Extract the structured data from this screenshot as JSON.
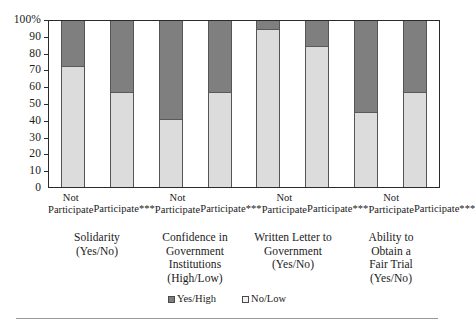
{
  "chart_data": {
    "type": "bar",
    "subtype": "stacked-100-percent",
    "title": "",
    "xlabel": "",
    "ylabel": "",
    "ylim": [
      0,
      100
    ],
    "yticks": [
      "0",
      "10",
      "20",
      "30",
      "40",
      "50",
      "60",
      "70",
      "80",
      "90",
      "100%"
    ],
    "ytick_values": [
      0,
      10,
      20,
      30,
      40,
      50,
      60,
      70,
      80,
      90,
      100
    ],
    "grid": false,
    "legend_position": "bottom-center",
    "categories": [
      "Not Participate",
      "Participate***",
      "Not Participate",
      "Participate***",
      "Not Participate",
      "Participate***",
      "Not Participate",
      "Participate***"
    ],
    "groups": [
      {
        "label": "Solidarity\n(Yes/No)",
        "lines": [
          "Solidarity",
          "(Yes/No)"
        ],
        "categories": [
          "Not Participate",
          "Participate***"
        ]
      },
      {
        "label": "Confidence in Government Institutions (High/Low)",
        "lines": [
          "Confidence in",
          "Government",
          "Institutions",
          "(High/Low)"
        ],
        "categories": [
          "Not Participate",
          "Participate***"
        ]
      },
      {
        "label": "Written Letter to Government (Yes/No)",
        "lines": [
          "Written Letter to",
          "Government",
          "(Yes/No)"
        ],
        "categories": [
          "Not Participate",
          "Participate***"
        ]
      },
      {
        "label": "Ability to Obtain a Fair Trial (Yes/No)",
        "lines": [
          "Ability to",
          "Obtain a",
          "Fair Trial",
          "(Yes/No)"
        ],
        "categories": [
          "Not Participate",
          "Participate***"
        ]
      }
    ],
    "series": [
      {
        "name": "No/Low",
        "color": "#dcdcdc",
        "values": [
          73,
          57,
          41,
          57,
          95,
          85,
          45,
          57
        ]
      },
      {
        "name": "Yes/High",
        "color": "#7f7f7f",
        "values": [
          27,
          43,
          59,
          43,
          5,
          15,
          55,
          43
        ]
      }
    ],
    "legend": [
      {
        "label": "Yes/High",
        "color": "#7f7f7f"
      },
      {
        "label": "No/Low",
        "color": "#f2f2f2"
      }
    ],
    "bars": [
      {
        "group": "Solidarity",
        "category": "Not Participate",
        "low": 73,
        "high": 27
      },
      {
        "group": "Solidarity",
        "category": "Participate***",
        "low": 57,
        "high": 43
      },
      {
        "group": "Confidence in Government Institutions",
        "category": "Not Participate",
        "low": 41,
        "high": 59
      },
      {
        "group": "Confidence in Government Institutions",
        "category": "Participate***",
        "low": 57,
        "high": 43
      },
      {
        "group": "Written Letter to Government",
        "category": "Not Participate",
        "low": 95,
        "high": 5
      },
      {
        "group": "Written Letter to Government",
        "category": "Participate***",
        "low": 85,
        "high": 15
      },
      {
        "group": "Ability to Obtain a Fair Trial",
        "category": "Not Participate",
        "low": 45,
        "high": 55
      },
      {
        "group": "Ability to Obtain a Fair Trial",
        "category": "Participate***",
        "low": 57,
        "high": 43
      }
    ]
  },
  "xaxis": {
    "tick_labels": [
      {
        "line1": "Not",
        "line2": "Participate"
      },
      {
        "line1": "Participate***",
        "line2": ""
      },
      {
        "line1": "Not",
        "line2": "Participate"
      },
      {
        "line1": "Participate***",
        "line2": ""
      },
      {
        "line1": "Not",
        "line2": "Participate"
      },
      {
        "line1": "Participate***",
        "line2": ""
      },
      {
        "line1": "Not",
        "line2": "Participate"
      },
      {
        "line1": "Participate***",
        "line2": ""
      }
    ]
  },
  "colors": {
    "high": "#7f7f7f",
    "low": "#dcdcdc",
    "axis": "#2b2b2b",
    "rule": "#9a9a9a"
  }
}
